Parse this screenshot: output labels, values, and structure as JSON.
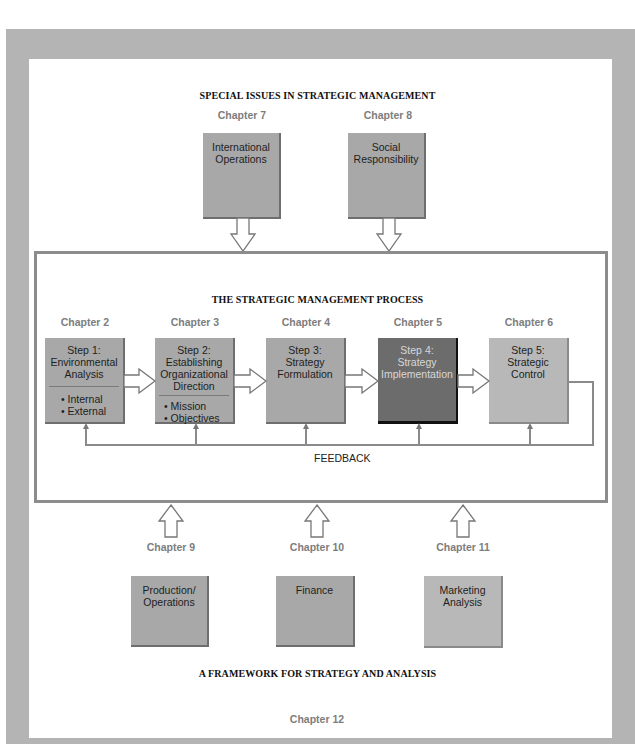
{
  "special_issues": {
    "title": "SPECIAL ISSUES IN STRATEGIC MANAGEMENT",
    "items": [
      {
        "chapter": "Chapter 7",
        "line1": "International",
        "line2": "Operations"
      },
      {
        "chapter": "Chapter 8",
        "line1": "Social",
        "line2": "Responsibility"
      }
    ]
  },
  "process": {
    "title": "THE STRATEGIC MANAGEMENT PROCESS",
    "steps": [
      {
        "chapter": "Chapter 2",
        "lines": [
          "Step 1:",
          "Environmental",
          "Analysis"
        ],
        "bullets": [
          "• Internal",
          "• External"
        ]
      },
      {
        "chapter": "Chapter 3",
        "lines": [
          "Step 2:",
          "Establishing",
          "Organizational",
          "Direction"
        ],
        "bullets": [
          "• Mission",
          "• Objectives"
        ]
      },
      {
        "chapter": "Chapter 4",
        "lines": [
          "Step 3:",
          "Strategy",
          "Formulation"
        ],
        "bullets": []
      },
      {
        "chapter": "Chapter 5",
        "lines": [
          "Step 4:",
          "Strategy",
          "Implementation"
        ],
        "bullets": [],
        "highlighted": true
      },
      {
        "chapter": "Chapter 6",
        "lines": [
          "Step 5:",
          "Strategic",
          "Control"
        ],
        "bullets": []
      }
    ],
    "feedback_label": "FEEDBACK"
  },
  "framework": {
    "title": "A FRAMEWORK FOR STRATEGY AND ANALYSIS",
    "items": [
      {
        "chapter": "Chapter 9",
        "line1": "Production/",
        "line2": "Operations"
      },
      {
        "chapter": "Chapter 10",
        "line1": "Finance",
        "line2": ""
      },
      {
        "chapter": "Chapter 11",
        "line1": "Marketing",
        "line2": "Analysis"
      }
    ],
    "footer_chapter": "Chapter 12"
  },
  "colors": {
    "frame": "#b4b4b4",
    "box": "#a8a8a8",
    "highlight_box": "#6c6c6c",
    "border": "#8c8c8c"
  }
}
